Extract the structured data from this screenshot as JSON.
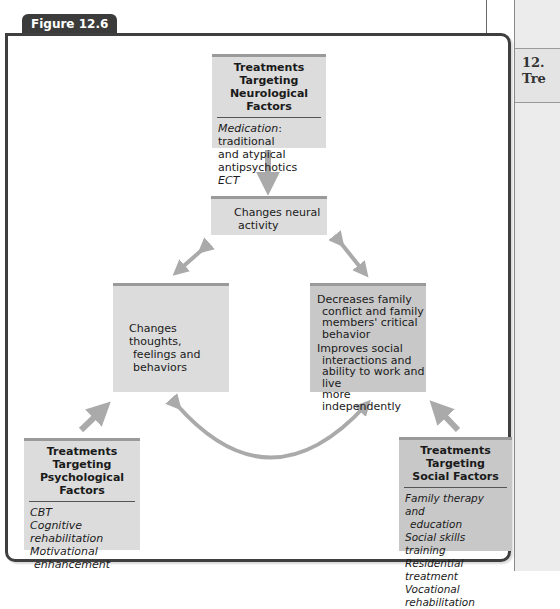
{
  "figure": {
    "label": "Figure 12.6"
  },
  "side": {
    "text": "12.\nTre"
  },
  "boxes": {
    "neurological": {
      "title_line1": "Treatments Targeting",
      "title_line2": "Neurological Factors",
      "items": [
        {
          "italic": "Medication",
          "plain": ": traditional",
          "cont1": "and atypical",
          "cont2": "antipsychotics"
        },
        {
          "italic": "ECT"
        }
      ]
    },
    "neural": {
      "line1": "Changes neural",
      "line2": "activity"
    },
    "thoughts": {
      "line1": "Changes thoughts,",
      "line2": "feelings and",
      "line3": "behaviors"
    },
    "social_outcome": {
      "p1_line1": "Decreases family",
      "p1_line2": "conflict and family",
      "p1_line3": "members' critical",
      "p1_line4": "behavior",
      "p2_line1": "Improves social",
      "p2_line2": "interactions and",
      "p2_line3": "ability to work and live",
      "p2_line4": "more independently"
    },
    "psychological": {
      "title_line1": "Treatments Targeting",
      "title_line2": "Psychological Factors",
      "items": [
        "CBT",
        "Cognitive rehabilitation",
        "Motivational",
        "enhancement"
      ]
    },
    "social": {
      "title_line1": "Treatments Targeting",
      "title_line2": "Social Factors",
      "items": [
        "Family therapy and",
        "education",
        "Social skills training",
        "Residential treatment",
        "Vocational rehabilitation"
      ]
    }
  },
  "colors": {
    "box_fill": "#dcdcdc",
    "box_fill_dark": "#c8c8c8",
    "arrow": "#aaaaaa",
    "frame": "#3f3f3f",
    "tab": "#3b3b3b"
  }
}
